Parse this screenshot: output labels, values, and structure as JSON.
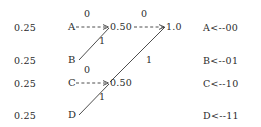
{
  "figure": {
    "type": "huffman-tree-diagram",
    "stroke_color": "#3a3a3a",
    "text_color": "#2b2b2b",
    "background": "#ffffff"
  },
  "probabilities": [
    {
      "value": "0.25"
    },
    {
      "value": "0.25"
    },
    {
      "value": "0.25"
    },
    {
      "value": "0.25"
    }
  ],
  "leaves": [
    {
      "label": "A"
    },
    {
      "label": "B"
    },
    {
      "label": "C"
    },
    {
      "label": "D"
    }
  ],
  "internal_nodes": [
    {
      "label": "0.50"
    },
    {
      "label": "0.50"
    },
    {
      "label": "1.0"
    }
  ],
  "edge_labels": [
    {
      "label": "0"
    },
    {
      "label": "1"
    },
    {
      "label": "0"
    },
    {
      "label": "1"
    },
    {
      "label": "0"
    },
    {
      "label": "1"
    }
  ],
  "codes": [
    {
      "text": "A<--00"
    },
    {
      "text": "B<--01"
    },
    {
      "text": "C<--10"
    },
    {
      "text": "D<--11"
    }
  ]
}
